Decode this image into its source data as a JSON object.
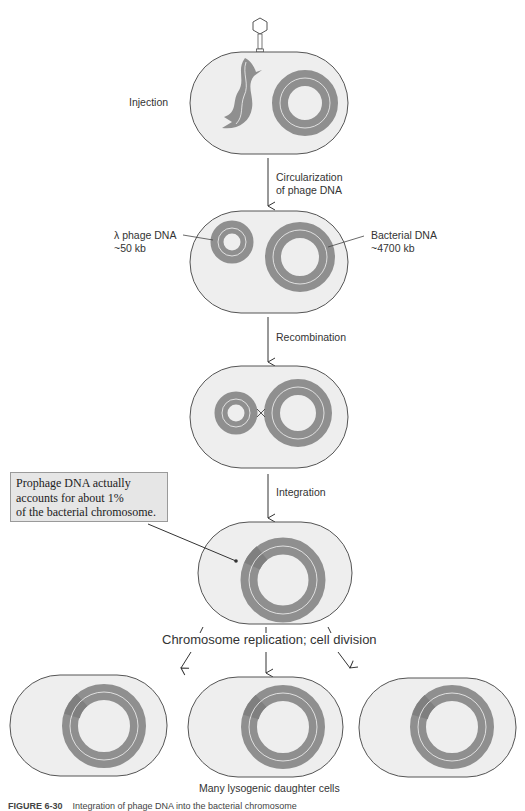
{
  "figure": {
    "colors": {
      "cell_fill": "#eeeeee",
      "cell_outline": "#555555",
      "dna_ring": "#8f8f8f",
      "prophage_segment": "#7f7f7f",
      "strand_line": "#f4f4f4",
      "callout_fill": "#e6e6e6"
    },
    "steps": [
      {
        "id": "injection",
        "label": "Injection"
      },
      {
        "id": "circularization",
        "label": "Circularization\nof phage DNA",
        "line1": "Circularization",
        "line2": "of phage DNA"
      },
      {
        "id": "recombination",
        "label": "Recombination"
      },
      {
        "id": "integration",
        "label": "Integration"
      },
      {
        "id": "replication",
        "label": "Chromosome replication; cell division"
      }
    ],
    "labels": {
      "phage_dna_line1": "λ phage DNA",
      "phage_dna_line2": "~50 kb",
      "bacterial_dna_line1": "Bacterial DNA",
      "bacterial_dna_line2": "~4700 kb",
      "crossover_symbol": "×"
    },
    "callout": {
      "line1": "Prophage DNA actually",
      "line2": "accounts for about 1%",
      "line3": "of the bacterial chromosome."
    },
    "daughter_cells_label": "Many lysogenic daughter cells",
    "daughter_cell_count": 3,
    "caption": {
      "number": "FIGURE 6-30",
      "text": "Integration of phage DNA into the bacterial chromosome"
    }
  }
}
